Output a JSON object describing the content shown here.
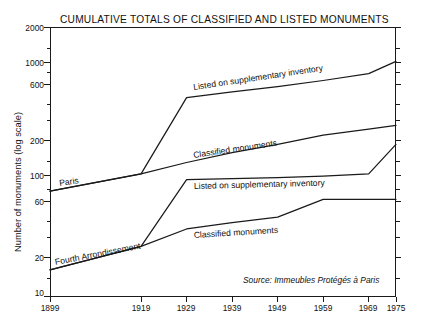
{
  "chart_data": {
    "type": "line",
    "title": "CUMULATIVE TOTALS OF CLASSIFIED AND LISTED MONUMENTS",
    "xlabel": "",
    "ylabel": "Number of monuments (log scale)",
    "yscale": "log",
    "ylim": [
      10,
      2000
    ],
    "xlim": [
      1899,
      1975
    ],
    "grid": false,
    "legend": "inline-labels",
    "source": "Source: Immeubles Protégés à Paris",
    "yticks": [
      10,
      20,
      60,
      100,
      200,
      600,
      1000,
      2000
    ],
    "ytick_labels": [
      "10",
      "20",
      "60",
      "100",
      "200",
      "600",
      "1000",
      "2000"
    ],
    "xticks": [
      1899,
      1919,
      1929,
      1939,
      1949,
      1959,
      1969,
      1975
    ],
    "xtick_labels": [
      "1899",
      "1919",
      "1929",
      "1939",
      "1949",
      "1959",
      "1969",
      "1975"
    ],
    "groups": [
      {
        "name": "Paris",
        "label": "Paris"
      },
      {
        "name": "Fourth Arrondissement",
        "label": "Fourth Arrondissement"
      }
    ],
    "series": [
      {
        "name": "Paris - Listed on supplementary inventory",
        "group": "Paris",
        "label": "Listed on supplementary inventory",
        "x": [
          1899,
          1919,
          1929,
          1939,
          1949,
          1959,
          1969,
          1975
        ],
        "values": [
          80,
          112,
          500,
          560,
          620,
          700,
          800,
          1020
        ]
      },
      {
        "name": "Paris - Classified monuments",
        "group": "Paris",
        "label": "Classified monuments",
        "x": [
          1899,
          1919,
          1929,
          1939,
          1949,
          1959,
          1969,
          1975
        ],
        "values": [
          80,
          112,
          140,
          170,
          200,
          240,
          270,
          290
        ]
      },
      {
        "name": "Fourth Arrondissement - Listed on supplementary inventory",
        "group": "Fourth Arrondissement",
        "label": "Listed on supplementary inventory",
        "x": [
          1899,
          1919,
          1929,
          1939,
          1949,
          1959,
          1969,
          1975
        ],
        "values": [
          17,
          27,
          100,
          102,
          104,
          107,
          112,
          200
        ]
      },
      {
        "name": "Fourth Arrondissement - Classified monuments",
        "group": "Fourth Arrondissement",
        "label": "Classified monuments",
        "x": [
          1899,
          1919,
          1929,
          1939,
          1949,
          1959,
          1969,
          1975
        ],
        "values": [
          17,
          27,
          38,
          43,
          48,
          68,
          68,
          68
        ]
      }
    ],
    "annotations": [
      {
        "text": "Listed on supplementary inventory",
        "near": "paris-listed",
        "rotation": -9
      },
      {
        "text": "Classified monuments",
        "near": "paris-classified",
        "rotation": -9
      },
      {
        "text": "Paris",
        "near": "paris-origin",
        "rotation": -9
      },
      {
        "text": "Listed on supplementary inventory",
        "near": "fourth-listed",
        "rotation": -2
      },
      {
        "text": "Classified monuments",
        "near": "fourth-classified",
        "rotation": -4
      },
      {
        "text": "Fourth Arrondissement",
        "near": "fourth-origin",
        "rotation": -12
      }
    ]
  },
  "colors": {
    "line": "#1a1a1a",
    "axis": "#1a1a1a",
    "background": "#ffffff",
    "text": "#111111"
  }
}
